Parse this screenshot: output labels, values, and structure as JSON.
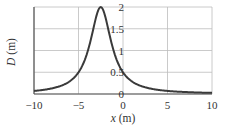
{
  "chart_data": {
    "type": "line",
    "title": "",
    "xlabel": "x (m)",
    "ylabel": "D (m)",
    "xlim": [
      -10,
      10
    ],
    "ylim": [
      0,
      2
    ],
    "grid": true,
    "legend": null,
    "x_ticks": [
      "−10",
      "−5",
      "0",
      "5",
      "10"
    ],
    "y_ticks": [
      "0",
      "0.5",
      "1",
      "1.5",
      "2"
    ],
    "series": [
      {
        "name": "D(x)",
        "x": [
          -10,
          -8,
          -6,
          -5,
          -4,
          -3.5,
          -3,
          -2.5,
          -2,
          -1.5,
          -1,
          0,
          1,
          2,
          3,
          5,
          7,
          10
        ],
        "values": [
          0.07,
          0.13,
          0.29,
          0.5,
          0.96,
          1.35,
          1.78,
          2.0,
          1.78,
          1.35,
          0.96,
          0.5,
          0.29,
          0.18,
          0.13,
          0.07,
          0.05,
          0.03
        ]
      }
    ],
    "peak": {
      "x": -2.5,
      "y": 2.0
    }
  },
  "labels": {
    "x_axis": {
      "var": "x",
      "unit": " (m)"
    },
    "y_axis": {
      "var": "D",
      "unit": " (m)"
    }
  }
}
